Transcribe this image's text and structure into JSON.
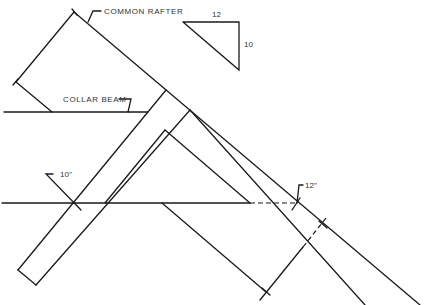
{
  "diagram": {
    "labels": {
      "common_rafter": "COMMON RAFTER",
      "collar_beam": "COLLAR BEAM",
      "pitch_run": "12",
      "pitch_rise": "10",
      "dim_left": "10\"",
      "dim_right": "12\""
    },
    "colors": {
      "line": "#1a1a1a",
      "text": "#333333",
      "background": "#ffffff"
    }
  }
}
